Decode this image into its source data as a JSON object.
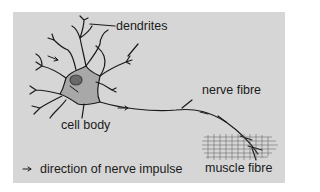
{
  "diagram": {
    "labels": {
      "dendrites": "dendrites",
      "cell_body": "cell body",
      "nerve_fibre": "nerve fibre",
      "muscle_fibre": "muscle fibre"
    },
    "legend": {
      "arrow_symbol": "→",
      "text": "direction of nerve impulse"
    },
    "colors": {
      "background_panel": "#d6d6d6",
      "cell_body_fill": "#a8a8a8",
      "nucleus_fill": "#6a6a6a",
      "line": "#1a1a1a"
    }
  }
}
